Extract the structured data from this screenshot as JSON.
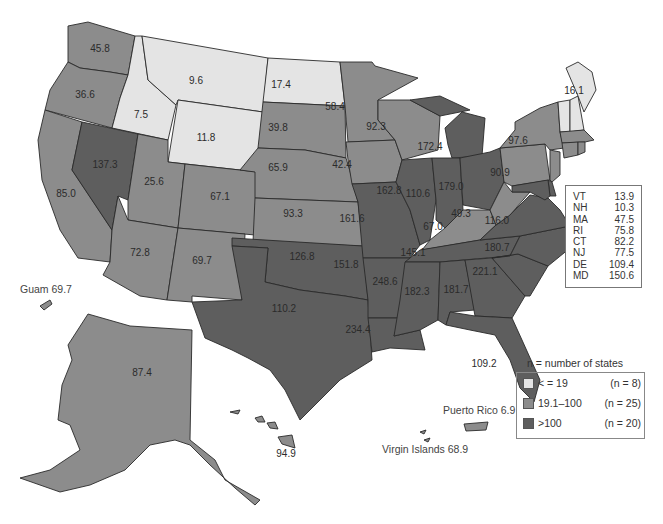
{
  "legend": {
    "title": "n = number of states",
    "items": [
      {
        "label": "< = 19",
        "count": "(n = 8)",
        "color": "#e4e4e4"
      },
      {
        "label": "19.1–100",
        "count": "(n = 25)",
        "color": "#8c8c8c"
      },
      {
        "label": ">100",
        "count": "(n = 20)",
        "color": "#5e5e5e"
      }
    ]
  },
  "inset_table": {
    "rows": [
      {
        "state": "VT",
        "value": "13.9"
      },
      {
        "state": "NH",
        "value": "10.3"
      },
      {
        "state": "MA",
        "value": "47.5"
      },
      {
        "state": "RI",
        "value": "75.8"
      },
      {
        "state": "CT",
        "value": "82.2"
      },
      {
        "state": "NJ",
        "value": "77.5"
      },
      {
        "state": "DE",
        "value": "109.4"
      },
      {
        "state": "MD",
        "value": "150.6"
      }
    ]
  },
  "territories": {
    "guam": "Guam 69.7",
    "puerto_rico": "Puerto Rico 6.9",
    "virgin_islands": "Virgin Islands 68.9"
  },
  "states": {
    "WA": "45.8",
    "OR": "36.6",
    "CA": "85.0",
    "ID": "7.5",
    "NV": "137.3",
    "MT": "9.6",
    "WY": "11.8",
    "UT": "25.6",
    "AZ": "72.8",
    "CO": "67.1",
    "NM": "69.7",
    "ND": "17.4",
    "SD": "39.8",
    "NE": "65.9",
    "KS": "93.3",
    "OK": "126.8",
    "TX": "110.2",
    "MN": "58.4",
    "IA": "42.4",
    "MO": "161.6",
    "AR": "151.8",
    "LA": "234.4",
    "WI": "92.3",
    "IL": "162.8",
    "MI": "172.4",
    "IN": "110.6",
    "OH": "179.0",
    "KY": "67.0",
    "TN": "145.1",
    "MS": "248.6",
    "AL": "182.3",
    "GA": "181.7",
    "FL": "109.2",
    "SC": "221.1",
    "NC": "180.7",
    "VA": "116.0",
    "WV": "49.3",
    "PA": "90.9",
    "NY": "97.6",
    "ME": "16.1",
    "AK": "87.4",
    "HI": "94.9"
  },
  "colors": {
    "low": "#e4e4e4",
    "mid": "#8c8c8c",
    "high": "#5e5e5e",
    "border": "#2a2a2a"
  }
}
